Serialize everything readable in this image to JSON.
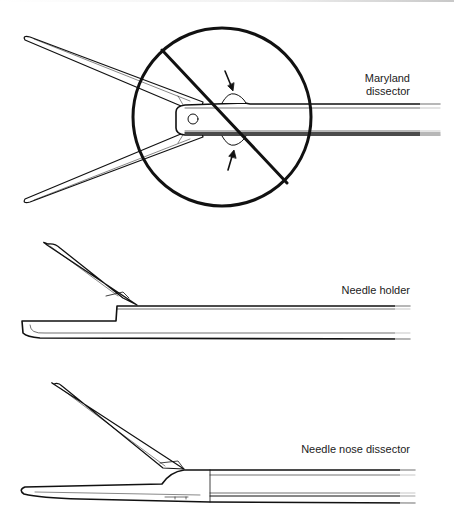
{
  "diagram": {
    "instruments": [
      {
        "id": "maryland",
        "label_line1": "Maryland",
        "label_line2": "dissector",
        "prohibited": true
      },
      {
        "id": "needle-holder",
        "label": "Needle holder",
        "prohibited": false
      },
      {
        "id": "needle-nose",
        "label": "Needle nose dissector",
        "prohibited": false
      }
    ],
    "colors": {
      "stroke": "#111111",
      "background": "#ffffff"
    }
  }
}
